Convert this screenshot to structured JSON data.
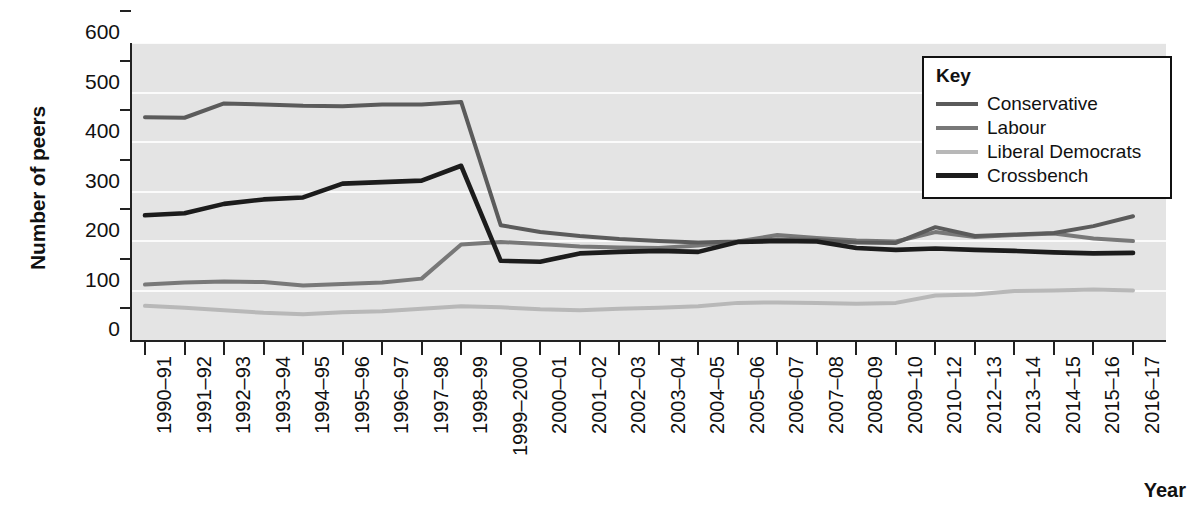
{
  "chart_data": {
    "type": "line",
    "title": "",
    "xlabel": "Year",
    "ylabel": "Number of peers",
    "ylim": [
      0,
      600
    ],
    "yticks": [
      0,
      100,
      200,
      300,
      400,
      500,
      600
    ],
    "grid": "horizontal",
    "legend_position": "top-right",
    "legend_title": "Key",
    "categories": [
      "1990–91",
      "1991–92",
      "1992–93",
      "1993–94",
      "1994–95",
      "1995–96",
      "1996–97",
      "1997–98",
      "1998–99",
      "1999–2000",
      "2000–01",
      "2001–02",
      "2002–03",
      "2003–04",
      "2004–05",
      "2005–06",
      "2006–07",
      "2007–08",
      "2008–09",
      "2009–10",
      "2010–12",
      "2012–13",
      "2013–14",
      "2014–15",
      "2015–16",
      "2016–17"
    ],
    "series": [
      {
        "name": "Conservative",
        "color": "#5b5b5b",
        "values": [
          450,
          449,
          478,
          476,
          473,
          472,
          476,
          476,
          481,
          232,
          218,
          210,
          204,
          200,
          197,
          199,
          203,
          202,
          197,
          196,
          228,
          210,
          213,
          216,
          230,
          250
        ]
      },
      {
        "name": "Labour",
        "color": "#787878",
        "values": [
          112,
          116,
          118,
          117,
          110,
          113,
          116,
          124,
          193,
          198,
          194,
          189,
          187,
          186,
          191,
          199,
          212,
          206,
          201,
          199,
          218,
          208,
          212,
          215,
          205,
          200
        ]
      },
      {
        "name": "Liberal Democrats",
        "color": "#b8b8b8",
        "values": [
          69,
          65,
          60,
          55,
          52,
          56,
          58,
          63,
          68,
          66,
          62,
          60,
          63,
          65,
          68,
          75,
          76,
          75,
          73,
          75,
          90,
          92,
          99,
          100,
          102,
          100
        ]
      },
      {
        "name": "Crossbench",
        "color": "#1c1c1c",
        "values": [
          252,
          256,
          275,
          284,
          288,
          316,
          319,
          322,
          352,
          160,
          158,
          175,
          178,
          180,
          178,
          198,
          200,
          199,
          186,
          182,
          185,
          182,
          180,
          177,
          175,
          176
        ]
      }
    ]
  }
}
